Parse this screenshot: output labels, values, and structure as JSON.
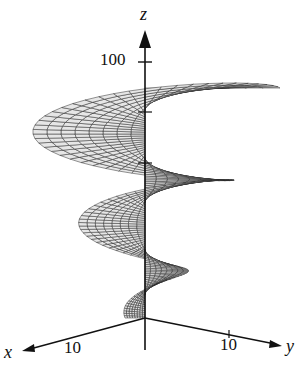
{
  "figure": {
    "type": "3d-surface",
    "axes": {
      "x": {
        "label": "x",
        "tick": "10"
      },
      "y": {
        "label": "y",
        "tick": "10"
      },
      "z": {
        "label": "z",
        "tick": "100"
      }
    },
    "colors": {
      "mesh": "#2a2a2a",
      "fill": "#e6e6e6",
      "axis": "#111111"
    }
  }
}
